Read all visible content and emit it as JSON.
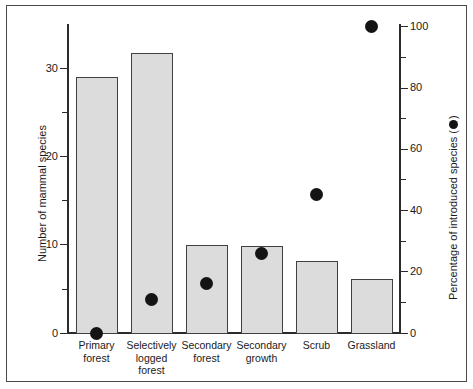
{
  "chart_data": {
    "type": "bar",
    "title": "",
    "subtitle": "",
    "xlabel": "",
    "ylabel": "Number of mammal species",
    "y2label": "Percentage of introduced species (  )",
    "categories": [
      "Primary\nforest",
      "Selectively\nlogged\nforest",
      "Secondary\nforest",
      "Secondary\ngrowth",
      "Scrub",
      "Grassland"
    ],
    "series": [
      {
        "name": "Number of mammal species",
        "render": "bar",
        "axis": "left",
        "values": [
          29.4,
          32.2,
          10.1,
          10.0,
          8.3,
          6.2
        ]
      },
      {
        "name": "Percentage of introduced species",
        "render": "scatter",
        "axis": "right",
        "marker": "filled-circle",
        "values": [
          0,
          11,
          16,
          26,
          45,
          100
        ]
      }
    ],
    "ylim": [
      0,
      35.5
    ],
    "y2lim": [
      0,
      108
    ],
    "left_axis": {
      "major_ticks": [
        0,
        10,
        20,
        30
      ],
      "major_tick_labels": [
        "0",
        "10",
        "20",
        "30"
      ],
      "minor_ticks": [
        5,
        15,
        25,
        35
      ]
    },
    "right_axis": {
      "major_ticks": [
        0,
        20,
        40,
        60,
        80,
        100
      ],
      "major_tick_labels": [
        "0",
        "20",
        "40",
        "60",
        "80",
        "100"
      ],
      "minor_ticks": [
        10,
        30,
        50,
        70,
        90
      ]
    },
    "grid": false,
    "legend_position": "axis-label-inline",
    "colors": {
      "bar_fill": "#dcdcdc",
      "bar_stroke": "#404040",
      "dot": "#141414",
      "axis": "#2b2b2b",
      "text": "#1a1a1a",
      "background": "#ffffff",
      "frame": "#4a4a4a"
    }
  }
}
